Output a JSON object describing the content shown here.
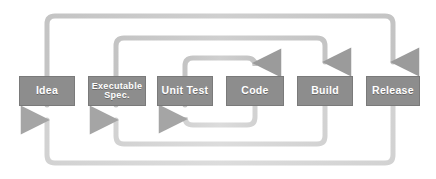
{
  "diagram": {
    "type": "flow-diagram",
    "canvas": {
      "width": 436,
      "height": 179,
      "background": "#ffffff"
    },
    "colors": {
      "box_fill": "#8d8d8d",
      "box_border": "#7a7a7a",
      "box_text": "#ffffff",
      "connector": "#b3b3b3",
      "connector_dark": "#9a9a9a",
      "connector_light": "#d6d6d6"
    },
    "stages": [
      {
        "id": "idea",
        "label": "Idea",
        "lines": [
          "Idea"
        ],
        "order": 1,
        "x": 19,
        "y": 76,
        "w": 56,
        "h": 30,
        "font_size_class": "size-1"
      },
      {
        "id": "executable-spec",
        "label": "Executable Spec.",
        "lines": [
          "Executable",
          "Spec."
        ],
        "order": 2,
        "x": 88,
        "y": 76,
        "w": 58,
        "h": 30,
        "font_size_class": "size-2"
      },
      {
        "id": "unit-test",
        "label": "Unit Test",
        "lines": [
          "Unit Test"
        ],
        "order": 3,
        "x": 157,
        "y": 76,
        "w": 56,
        "h": 30,
        "font_size_class": "size-1"
      },
      {
        "id": "code",
        "label": "Code",
        "lines": [
          "Code"
        ],
        "order": 4,
        "x": 226,
        "y": 76,
        "w": 58,
        "h": 30,
        "font_size_class": "size-1"
      },
      {
        "id": "build",
        "label": "Build",
        "lines": [
          "Build"
        ],
        "order": 5,
        "x": 297,
        "y": 76,
        "w": 56,
        "h": 30,
        "font_size_class": "size-1"
      },
      {
        "id": "release",
        "label": "Release",
        "lines": [
          "Release"
        ],
        "order": 6,
        "x": 366,
        "y": 76,
        "w": 54,
        "h": 30,
        "font_size_class": "size-1"
      }
    ],
    "feedback_loops": [
      {
        "id": "inner-forward",
        "name": "unit-test-to-code",
        "direction": "top",
        "from": "unit-test",
        "to": "code",
        "level": 1
      },
      {
        "id": "mid-forward",
        "name": "executable-spec-to-build",
        "direction": "top",
        "from": "executable-spec",
        "to": "build",
        "level": 2
      },
      {
        "id": "outer-forward",
        "name": "idea-to-release",
        "direction": "top",
        "from": "idea",
        "to": "release",
        "level": 3
      },
      {
        "id": "inner-return",
        "name": "code-to-unit-test",
        "direction": "bottom",
        "from": "code",
        "to": "unit-test",
        "level": 1
      },
      {
        "id": "mid-return",
        "name": "build-to-executable-spec",
        "direction": "bottom",
        "from": "build",
        "to": "executable-spec",
        "level": 2
      },
      {
        "id": "outer-return",
        "name": "release-to-idea",
        "direction": "bottom",
        "from": "release",
        "to": "idea",
        "level": 3
      }
    ]
  }
}
